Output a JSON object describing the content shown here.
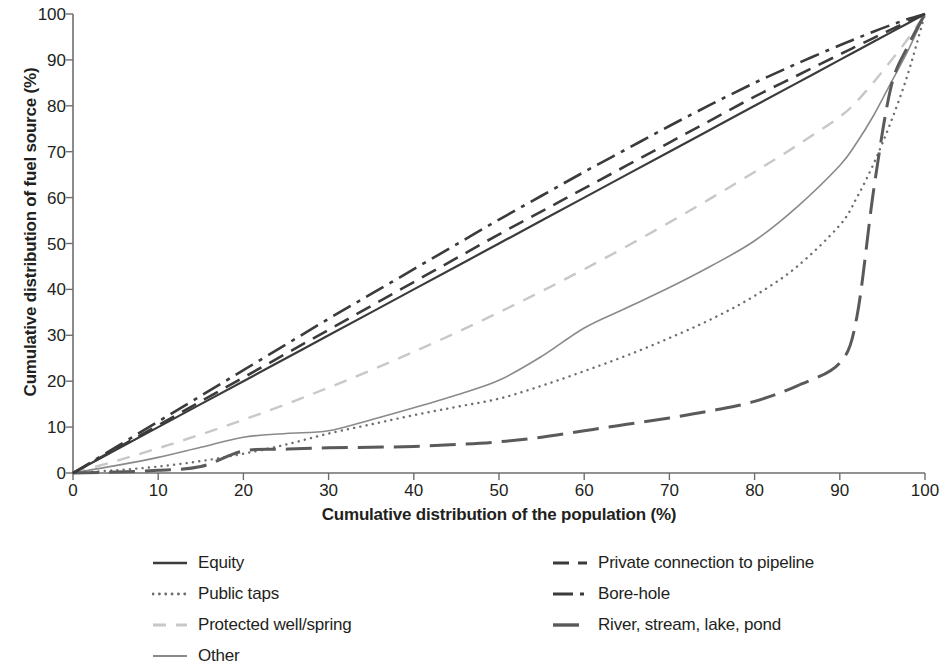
{
  "chart_data": {
    "type": "line",
    "title": "",
    "xlabel": "Cumulative distribution of the population (%)",
    "ylabel": "Cumulative distribution of fuel source (%)",
    "xlim": [
      0,
      100
    ],
    "ylim": [
      0,
      100
    ],
    "xticks": [
      0,
      10,
      20,
      30,
      40,
      50,
      60,
      70,
      80,
      90,
      100
    ],
    "yticks": [
      0,
      10,
      20,
      30,
      40,
      50,
      60,
      70,
      80,
      90,
      100
    ],
    "grid": false,
    "legend_position": "bottom",
    "x": [
      0,
      5,
      10,
      15,
      20,
      25,
      30,
      35,
      40,
      45,
      50,
      55,
      60,
      65,
      70,
      75,
      80,
      85,
      90,
      92,
      94,
      96,
      98,
      100
    ],
    "series": [
      {
        "name": "Equity",
        "style": "solid",
        "color": "#3b3b3b",
        "width": 2.2,
        "values": [
          0,
          5,
          10,
          15,
          20,
          25,
          30,
          35,
          40,
          45,
          50,
          55,
          60,
          65,
          70,
          75,
          80,
          85,
          90,
          92,
          94,
          96,
          98,
          100
        ]
      },
      {
        "name": "Public taps",
        "style": "dotted",
        "color": "#6e6e6e",
        "width": 2.4,
        "values": [
          0,
          0.6,
          1.4,
          2.6,
          4.2,
          6.2,
          8.6,
          10.6,
          12.6,
          14.4,
          16.2,
          19.0,
          22.2,
          25.6,
          29.4,
          33.6,
          38.6,
          45.0,
          54.0,
          60.0,
          67.5,
          76.5,
          87.0,
          100
        ]
      },
      {
        "name": "Protected well/spring",
        "style": "dashed-light",
        "color": "#c8c8c8",
        "width": 2.4,
        "values": [
          0,
          2.6,
          5.4,
          8.4,
          11.6,
          15.0,
          18.6,
          22.4,
          26.4,
          30.6,
          35.0,
          39.6,
          44.4,
          49.4,
          54.6,
          60.0,
          65.6,
          71.4,
          77.6,
          81.0,
          85.2,
          89.8,
          94.6,
          100
        ]
      },
      {
        "name": "Other",
        "style": "solid-gray",
        "color": "#8a8a8a",
        "width": 1.6,
        "values": [
          0,
          1.6,
          3.4,
          5.6,
          7.8,
          8.6,
          9.2,
          11.6,
          14.2,
          17.0,
          20.2,
          25.4,
          31.6,
          36.0,
          40.4,
          45.2,
          50.6,
          58.0,
          67.0,
          72.0,
          78.0,
          85.0,
          92.0,
          100
        ]
      },
      {
        "name": "Private connection to pipeline",
        "style": "dashed-dark",
        "color": "#3b3b3b",
        "width": 2.6,
        "values": [
          0,
          5.2,
          10.4,
          15.6,
          20.8,
          26.0,
          31.2,
          36.4,
          41.6,
          46.8,
          52.0,
          57.0,
          62.0,
          67.0,
          72.0,
          77.0,
          82.0,
          86.6,
          91.2,
          93.0,
          94.8,
          96.6,
          98.3,
          100
        ]
      },
      {
        "name": "Bore-hole",
        "style": "dashdot",
        "color": "#3b3b3b",
        "width": 2.6,
        "values": [
          0,
          5.6,
          11.2,
          16.8,
          22.4,
          28.0,
          33.6,
          39.0,
          44.4,
          49.8,
          55.2,
          60.4,
          65.6,
          70.6,
          75.6,
          80.4,
          85.0,
          89.2,
          93.2,
          94.7,
          96.2,
          97.6,
          98.9,
          100
        ]
      },
      {
        "name": "River, stream, lake, pond",
        "style": "longdash",
        "color": "#5a5a5a",
        "width": 3.0,
        "values": [
          0,
          0.2,
          0.6,
          1.4,
          4.8,
          5.2,
          5.5,
          5.6,
          5.8,
          6.2,
          6.8,
          7.8,
          9.2,
          10.6,
          12.0,
          13.6,
          15.6,
          19.0,
          24.0,
          34.0,
          62.0,
          84.0,
          93.0,
          100
        ]
      }
    ]
  },
  "legend": {
    "items": [
      {
        "label": "Equity",
        "swatch": "solid",
        "color": "#3b3b3b",
        "column": "left"
      },
      {
        "label": "Public taps",
        "swatch": "dotted",
        "color": "#6e6e6e",
        "column": "left"
      },
      {
        "label": "Protected well/spring",
        "swatch": "dashed-light",
        "color": "#c8c8c8",
        "column": "left"
      },
      {
        "label": "Other",
        "swatch": "solid-gray",
        "color": "#8a8a8a",
        "column": "left"
      },
      {
        "label": "Private connection to pipeline",
        "swatch": "dashed-dark",
        "color": "#3b3b3b",
        "column": "right"
      },
      {
        "label": "Bore-hole",
        "swatch": "dashdot",
        "color": "#3b3b3b",
        "column": "right"
      },
      {
        "label": "River, stream, lake, pond",
        "swatch": "longdash",
        "color": "#5a5a5a",
        "column": "right"
      }
    ]
  },
  "axis": {
    "color": "#6e6e6e",
    "tick_color": "#231f20"
  }
}
